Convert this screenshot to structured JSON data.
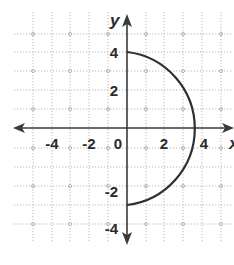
{
  "chart_data": {
    "type": "line",
    "title": "",
    "xlabel": "x",
    "ylabel": "y",
    "xlim": [
      -6,
      6
    ],
    "ylim": [
      -6,
      6
    ],
    "grid": true,
    "legend": null,
    "x_tick_labels": [
      "-4",
      "-2",
      "0",
      "2",
      "4"
    ],
    "y_tick_labels": [
      "4",
      "2",
      "-2",
      "-4"
    ],
    "series": [
      {
        "name": "semicircle",
        "description": "Right half of circle x^2 + y^2 = 16 (x >= 0), from (0,4) through (4,0) to (0,-4)",
        "points": [
          [
            0,
            4
          ],
          [
            1.5,
            3.71
          ],
          [
            2.83,
            2.83
          ],
          [
            3.71,
            1.5
          ],
          [
            4,
            0
          ],
          [
            3.71,
            -1.5
          ],
          [
            2.83,
            -2.83
          ],
          [
            1.5,
            -3.71
          ],
          [
            0,
            -4
          ]
        ]
      }
    ],
    "colors": {
      "curve": "#2f2f2f",
      "axis": "#3a3a3a",
      "grid": "#b8b8b8"
    }
  },
  "labels": {
    "x_axis_name": "x",
    "y_axis_name": "y",
    "x_ticks": [
      {
        "text": "-4",
        "x": 52,
        "y": 149
      },
      {
        "text": "-2",
        "x": 89,
        "y": 149
      },
      {
        "text": "0",
        "x": 118,
        "y": 149
      },
      {
        "text": "2",
        "x": 164,
        "y": 149
      },
      {
        "text": "4",
        "x": 204,
        "y": 149
      }
    ],
    "y_ticks": [
      {
        "text": "4",
        "x": 118,
        "y": 58
      },
      {
        "text": "2",
        "x": 118,
        "y": 96
      },
      {
        "text": "-2",
        "x": 118,
        "y": 197
      },
      {
        "text": "-4",
        "x": 118,
        "y": 234
      }
    ]
  }
}
